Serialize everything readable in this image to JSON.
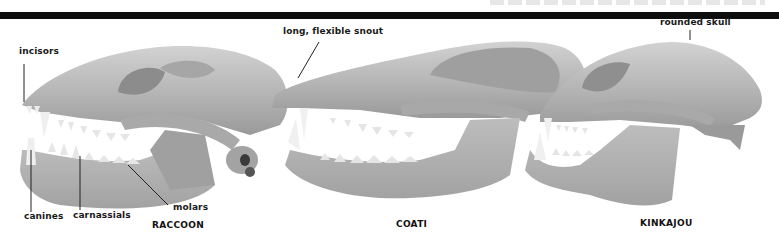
{
  "figure": {
    "header_caption_partial": "",
    "colors": {
      "bar": "#0d0d0d",
      "bone": "#b9b9b9",
      "bone_dark": "#8e8e8e",
      "bone_light": "#d6d6d6",
      "teeth": "#ececec",
      "text": "#1a1a1a"
    },
    "labels": {
      "incisors": "incisors",
      "snout": "long, flexible snout",
      "rounded_skull": "rounded skull",
      "canines": "canines",
      "carnassials": "carnassials",
      "molars": "molars"
    },
    "specimens": [
      {
        "name": "RACCOON"
      },
      {
        "name": "COATI"
      },
      {
        "name": "KINKAJOU"
      }
    ]
  }
}
